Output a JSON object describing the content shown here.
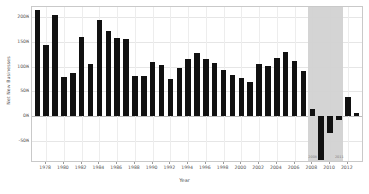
{
  "chart_data": {
    "type": "bar",
    "title": "",
    "xlabel": "Year",
    "ylabel": "Net New Businesses",
    "ylim": [
      -90000,
      220000
    ],
    "xlim": [
      1976.4,
      2013.6
    ],
    "grid": true,
    "legend": null,
    "ytick_labels": [
      "200K",
      "150K",
      "100K",
      "50K",
      "0K",
      "-50K"
    ],
    "ytick_values": [
      200000,
      150000,
      100000,
      50000,
      0,
      -50000
    ],
    "xtick_labels": [
      "1978",
      "1980",
      "1982",
      "1984",
      "1986",
      "1988",
      "1990",
      "1992",
      "1994",
      "1996",
      "1998",
      "2000",
      "2002",
      "2004",
      "2006",
      "2008",
      "2010",
      "2012"
    ],
    "xtick_values": [
      1978,
      1980,
      1982,
      1984,
      1986,
      1988,
      1990,
      1992,
      1994,
      1996,
      1998,
      2000,
      2002,
      2004,
      2006,
      2008,
      2010,
      2012
    ],
    "categories": [
      1977,
      1978,
      1979,
      1980,
      1981,
      1982,
      1983,
      1984,
      1985,
      1986,
      1987,
      1988,
      1989,
      1990,
      1991,
      1992,
      1993,
      1994,
      1995,
      1996,
      1997,
      1998,
      1999,
      2000,
      2001,
      2002,
      2003,
      2004,
      2005,
      2006,
      2007,
      2008,
      2009,
      2010,
      2011,
      2012,
      2013
    ],
    "values": [
      213000,
      143000,
      204000,
      80000,
      88000,
      159000,
      105000,
      193000,
      171000,
      158000,
      156000,
      82000,
      82000,
      110000,
      104000,
      75000,
      98000,
      115000,
      128000,
      115000,
      108000,
      94000,
      83000,
      77000,
      69000,
      106000,
      101000,
      118000,
      130000,
      111000,
      92000,
      14000,
      -88000,
      -33000,
      -8000,
      38000,
      7000
    ],
    "annotations": [
      {
        "label": "2008",
        "x": 2008
      },
      {
        "label": "2011",
        "x": 2011
      }
    ],
    "shaded_region": {
      "start": 2007.5,
      "end": 2011.5,
      "color": "#d2d2d2",
      "label": "recession band"
    },
    "bar_color": "#111111",
    "axis_color": "#c9c9c9",
    "grid_color": "#e6e6e6"
  }
}
